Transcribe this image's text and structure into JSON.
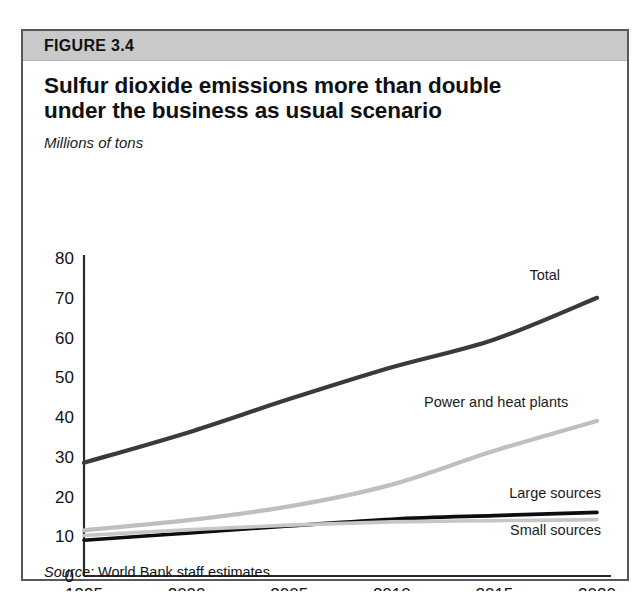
{
  "top_remnant": "clipped heading text above figure",
  "figure": {
    "label": "FIGURE 3.4",
    "title_line1": "Sulfur dioxide emissions more than double",
    "title_line2": "under the business as usual scenario",
    "units_caption": "Millions of tons",
    "source_keyword": "Source:",
    "source_text": " World Bank staff estimates."
  },
  "colors": {
    "frame": "#58585c",
    "header_band": "#c9c9c9",
    "axis": "#2b2b2e",
    "total": "#3a3a3d",
    "power_heat": "#bfbfbf",
    "large_sources": "#0d0d0f",
    "small_sources": "#c6c6c6"
  },
  "chart_data": {
    "type": "line",
    "title": "Sulfur dioxide emissions more than double under the business as usual scenario",
    "subtitle": "",
    "xlabel": "",
    "ylabel": "Millions of tons",
    "xlim": [
      1995,
      2020
    ],
    "ylim": [
      0,
      80
    ],
    "grid": false,
    "legend_position": "inline-end-of-line-labels",
    "x": [
      1995,
      2000,
      2005,
      2010,
      2015,
      2020
    ],
    "xticks": [
      "1995",
      "2000",
      "2005",
      "2010",
      "2015",
      "2020"
    ],
    "yticks": [
      "0",
      "10",
      "20",
      "30",
      "40",
      "50",
      "60",
      "70",
      "80"
    ],
    "ytick_values": [
      0,
      10,
      20,
      30,
      40,
      50,
      60,
      70,
      80
    ],
    "series": [
      {
        "name": "Total",
        "color": "#3a3a3d",
        "width": 4.2,
        "values": [
          28.5,
          36.0,
          44.5,
          52.5,
          59.5,
          70.0
        ],
        "label_x": 2018.2,
        "label_y": 74.5,
        "label_anchor": "end"
      },
      {
        "name": "Power and heat plants",
        "color": "#bfbfbf",
        "width": 4.2,
        "values": [
          11.5,
          14.0,
          17.5,
          23.0,
          31.5,
          39.0
        ],
        "label_x": 2018.6,
        "label_y": 42.5,
        "label_anchor": "end"
      },
      {
        "name": "Large sources",
        "color": "#0d0d0f",
        "width": 3.6,
        "values": [
          9.0,
          10.8,
          12.6,
          14.3,
          15.2,
          16.0
        ],
        "label_x": 2020.2,
        "label_y": 19.5,
        "label_anchor": "end"
      },
      {
        "name": "Small sources",
        "color": "#c6c6c6",
        "width": 3.6,
        "values": [
          10.2,
          11.6,
          12.8,
          13.6,
          13.9,
          14.2
        ],
        "label_x": 2020.2,
        "label_y": 10.3,
        "label_anchor": "end"
      }
    ]
  }
}
